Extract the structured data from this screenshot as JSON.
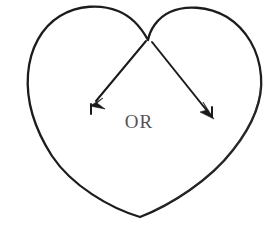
{
  "figure": {
    "background_color": "#ffffff",
    "width": 278,
    "height": 230,
    "shapes": {
      "heart": {
        "name": "heart-outline",
        "stroke_color": "#1c1c1c",
        "stroke_width": 2.3,
        "fill": "none",
        "notch_point": {
          "x": 148,
          "y": 40
        },
        "bottom_point": {
          "x": 140,
          "y": 217
        },
        "left_extent": {
          "x": 28,
          "y": 95
        },
        "right_extent": {
          "x": 262,
          "y": 98
        },
        "left_lobe_top": {
          "x": 95,
          "y": 11
        },
        "right_lobe_top": {
          "x": 205,
          "y": 12
        }
      },
      "arrow_left": {
        "name": "left-arrow",
        "stroke_color": "#1a1a1a",
        "stroke_width": 2.0,
        "start": {
          "x": 146,
          "y": 40
        },
        "end": {
          "x": 92,
          "y": 105
        },
        "direction": "down-left"
      },
      "arrow_right": {
        "name": "right-arrow",
        "stroke_color": "#1a1a1a",
        "stroke_width": 2.0,
        "start": {
          "x": 152,
          "y": 41
        },
        "end": {
          "x": 213,
          "y": 118
        },
        "direction": "down-right"
      }
    },
    "labels": {
      "or": "OR",
      "or_color": "#53535a",
      "or_font_size": 19,
      "or_center": {
        "x": 144,
        "y": 123
      }
    }
  }
}
